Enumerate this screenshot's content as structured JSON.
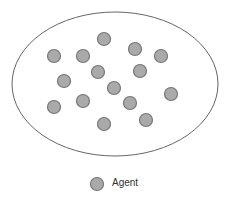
{
  "diagram": {
    "container": {
      "shape": "ellipse",
      "cx": 115,
      "cy": 84,
      "rx": 103,
      "ry": 72,
      "stroke": "#666666"
    },
    "agent_style": {
      "r": 6.5,
      "fill": "#aaaaaa",
      "stroke": "#777777"
    },
    "agents": [
      {
        "x": 104,
        "y": 39
      },
      {
        "x": 54,
        "y": 56
      },
      {
        "x": 83,
        "y": 56
      },
      {
        "x": 135,
        "y": 49
      },
      {
        "x": 161,
        "y": 56
      },
      {
        "x": 98,
        "y": 72
      },
      {
        "x": 140,
        "y": 71
      },
      {
        "x": 64,
        "y": 81
      },
      {
        "x": 114,
        "y": 88
      },
      {
        "x": 171,
        "y": 94
      },
      {
        "x": 54,
        "y": 107
      },
      {
        "x": 83,
        "y": 101
      },
      {
        "x": 130,
        "y": 103
      },
      {
        "x": 104,
        "y": 124
      },
      {
        "x": 146,
        "y": 120
      }
    ]
  },
  "legend": {
    "label": "Agent",
    "icon": "agent-circle-icon"
  }
}
